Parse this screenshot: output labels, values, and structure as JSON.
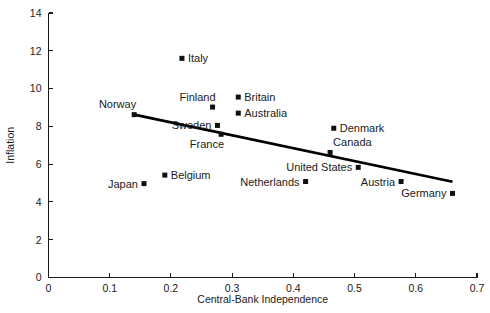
{
  "chart_data": {
    "type": "scatter",
    "title": "",
    "xlabel": "Central-Bank Independence",
    "ylabel": "Inflation",
    "xlim": [
      0,
      0.7
    ],
    "ylim": [
      0,
      14
    ],
    "xticks": [
      "0",
      "0.1",
      "0.2",
      "0.3",
      "0.4",
      "0.5",
      "0.6",
      "0.7"
    ],
    "xtick_values": [
      0,
      0.1,
      0.2,
      0.3,
      0.4,
      0.5,
      0.6,
      0.7
    ],
    "yticks": [
      "0",
      "2",
      "4",
      "6",
      "8",
      "10",
      "12",
      "14"
    ],
    "ytick_values": [
      0,
      2,
      4,
      6,
      8,
      10,
      12,
      14
    ],
    "grid": false,
    "legend": "none",
    "marker_shape": "filled-square",
    "marker_color": "#101010",
    "trendline": {
      "name": "regression-line",
      "color": "#000000",
      "x_start": 0.14,
      "y_start": 8.62,
      "x_end": 0.66,
      "y_end": 5.07
    },
    "points": [
      {
        "label": "Norway",
        "x": 0.14,
        "y": 8.62,
        "label_pos": "left-above"
      },
      {
        "label": "Italy",
        "x": 0.218,
        "y": 11.6,
        "label_pos": "right"
      },
      {
        "label": "Finland",
        "x": 0.268,
        "y": 9.02,
        "label_pos": "above-left"
      },
      {
        "label": "Sweden",
        "x": 0.276,
        "y": 8.05,
        "label_pos": "left"
      },
      {
        "label": "France",
        "x": 0.282,
        "y": 7.58,
        "label_pos": "below-left"
      },
      {
        "label": "Britain",
        "x": 0.31,
        "y": 9.55,
        "label_pos": "right"
      },
      {
        "label": "Australia",
        "x": 0.31,
        "y": 8.7,
        "label_pos": "right"
      },
      {
        "label": "Denmark",
        "x": 0.466,
        "y": 7.9,
        "label_pos": "right"
      },
      {
        "label": "Canada",
        "x": 0.46,
        "y": 6.62,
        "label_pos": "above-right"
      },
      {
        "label": "United States",
        "x": 0.506,
        "y": 5.83,
        "label_pos": "left"
      },
      {
        "label": "Netherlands",
        "x": 0.42,
        "y": 5.08,
        "label_pos": "left"
      },
      {
        "label": "Austria",
        "x": 0.576,
        "y": 5.08,
        "label_pos": "left"
      },
      {
        "label": "Germany",
        "x": 0.66,
        "y": 4.45,
        "label_pos": "left"
      },
      {
        "label": "Japan",
        "x": 0.156,
        "y": 4.97,
        "label_pos": "left"
      },
      {
        "label": "Belgium",
        "x": 0.19,
        "y": 5.42,
        "label_pos": "right"
      }
    ]
  }
}
